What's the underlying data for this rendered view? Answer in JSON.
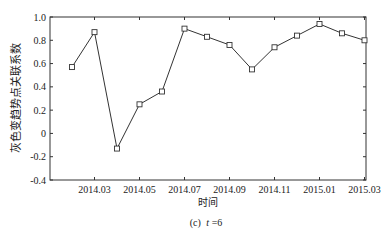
{
  "chart_data": {
    "type": "line",
    "title": "",
    "caption_prefix": "(c)",
    "caption_var": "t",
    "caption_eq": "=6",
    "xlabel": "时间",
    "ylabel": "灰色变趋势点关联系数",
    "ylim": [
      -0.4,
      1.0
    ],
    "yticks": [
      -0.4,
      -0.2,
      0,
      0.2,
      0.4,
      0.6,
      0.8,
      1.0
    ],
    "ytick_labels": [
      "-0.4",
      "-0.2",
      "0",
      "0.2",
      "0.4",
      "0.6",
      "0.8",
      "1.0"
    ],
    "xlim_months": [
      0.0,
      13.0
    ],
    "xticks_months": [
      1,
      3,
      5,
      7,
      9,
      11,
      13
    ],
    "xtick_labels": [
      "2014.03",
      "2014.05",
      "2014.07",
      "2014.09",
      "2014.11",
      "2015.01",
      "2015.03"
    ],
    "x": [
      "2014.02",
      "2014.03",
      "2014.04",
      "2014.05",
      "2014.06",
      "2014.07",
      "2014.08",
      "2014.09",
      "2014.10",
      "2014.11",
      "2014.12",
      "2015.01",
      "2015.02",
      "2015.03"
    ],
    "x_months": [
      0,
      1,
      2,
      3,
      4,
      5,
      6,
      7,
      8,
      9,
      10,
      11,
      12,
      13
    ],
    "values": [
      0.57,
      0.87,
      -0.13,
      0.25,
      0.36,
      0.9,
      0.83,
      0.76,
      0.55,
      0.74,
      0.84,
      0.94,
      0.86,
      0.8
    ],
    "marker": "square",
    "grid": false,
    "legend": "none"
  }
}
